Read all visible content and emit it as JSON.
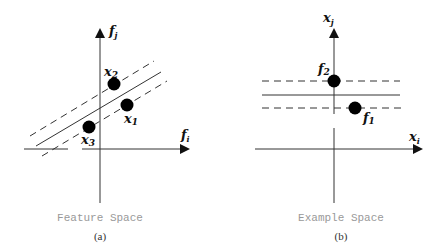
{
  "panels": [
    {
      "id": "a",
      "caption": "Feature Space",
      "panel_label": "(a)",
      "axes": {
        "x_label": "f",
        "x_sub": "i",
        "y_label": "f",
        "y_sub": "j"
      },
      "points": [
        {
          "label": "x",
          "sub": "2"
        },
        {
          "label": "x",
          "sub": "1"
        },
        {
          "label": "x",
          "sub": "3"
        }
      ]
    },
    {
      "id": "b",
      "caption": "Example Space",
      "panel_label": "(b)",
      "axes": {
        "x_label": "x",
        "x_sub": "i",
        "y_label": "x",
        "y_sub": "j"
      },
      "points": [
        {
          "label": "f",
          "sub": "2"
        },
        {
          "label": "f",
          "sub": "1"
        }
      ]
    }
  ]
}
